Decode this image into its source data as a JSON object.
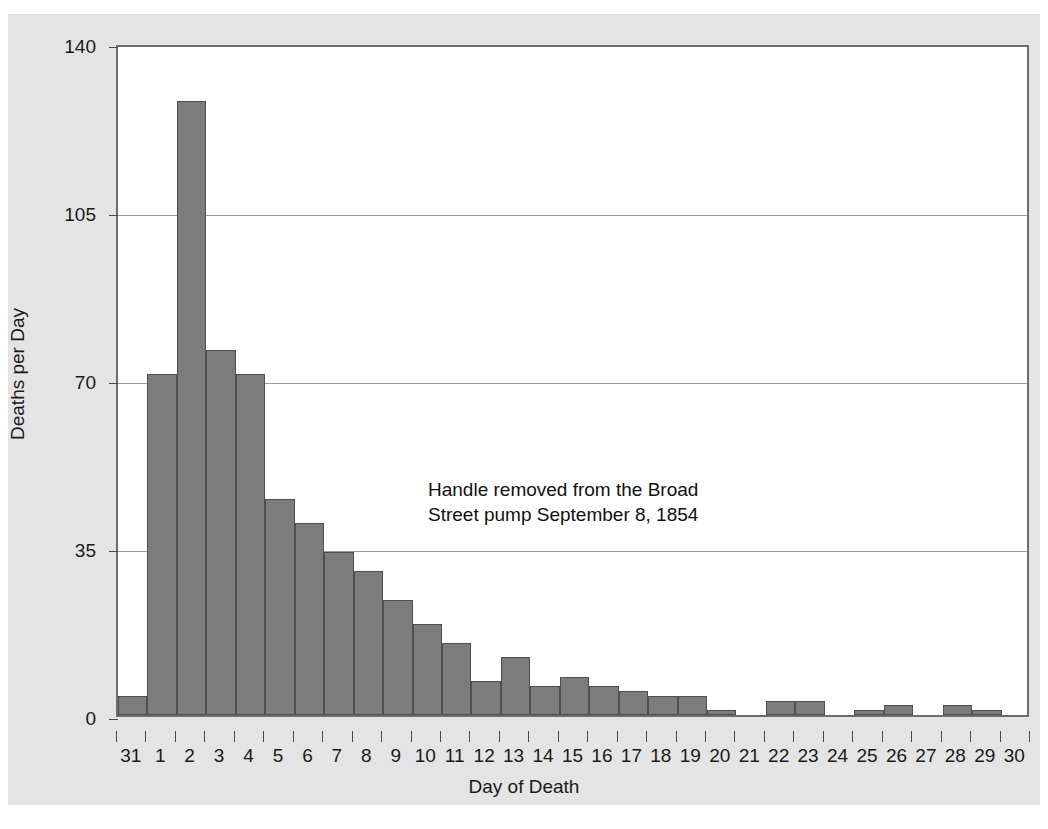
{
  "chart_data": {
    "type": "bar",
    "title": "",
    "xlabel": "Day of Death",
    "ylabel": "Deaths per Day",
    "ylim": [
      0,
      140
    ],
    "yticks": [
      0,
      35,
      70,
      105,
      140
    ],
    "ytick_labels": [
      "0",
      "35",
      "70",
      "105",
      "140"
    ],
    "grid": "horizontal",
    "legend": "none",
    "bar_color": "#7c7c7c",
    "bar_edge_color": "#4f4f4f",
    "background_color": "#e4e4e4",
    "plot_background_color": "#ffffff",
    "categories": [
      "31",
      "1",
      "2",
      "3",
      "4",
      "5",
      "6",
      "7",
      "8",
      "9",
      "10",
      "11",
      "12",
      "13",
      "14",
      "15",
      "16",
      "17",
      "18",
      "19",
      "20",
      "21",
      "22",
      "23",
      "24",
      "25",
      "26",
      "27",
      "28",
      "29",
      "30"
    ],
    "values": [
      4,
      71,
      128,
      76,
      71,
      45,
      40,
      34,
      30,
      24,
      19,
      15,
      7,
      12,
      6,
      8,
      6,
      5,
      4,
      4,
      1,
      0,
      3,
      3,
      0,
      1,
      2,
      0,
      2,
      1,
      0
    ],
    "annotations": [
      {
        "text": "Handle removed from the Broad\nStreet pump September 8, 1854",
        "x_category": "9",
        "y_value": 53
      }
    ]
  },
  "figure": {
    "ylabel": "Deaths per Day",
    "xlabel": "Day of Death",
    "annotation_text": "Handle removed from the Broad\nStreet pump September 8, 1854"
  }
}
